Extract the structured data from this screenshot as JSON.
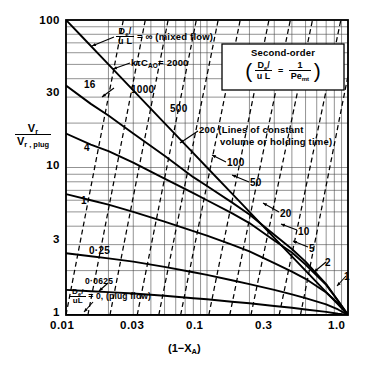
{
  "chart_data": {
    "type": "line",
    "title": "",
    "xlabel": "(1-X_A)",
    "ylabel": "V_r / V_r, plug",
    "xscale": "log",
    "yscale": "log",
    "xlim": [
      0.01,
      1.0
    ],
    "ylim": [
      1,
      100
    ],
    "grid": true,
    "legend_position": "upper-right",
    "xticks": [
      "0.01",
      "0.03",
      "0.1",
      "0.3",
      "1.0"
    ],
    "xtick_values": [
      0.01,
      0.03,
      0.1,
      0.3,
      1.0
    ],
    "yticks": [
      "1",
      "3",
      "10",
      "30",
      "100"
    ],
    "ytick_values": [
      1,
      3,
      10,
      30,
      100
    ],
    "series": [
      {
        "name": "De/uL = infinity (mixed flow)",
        "label": "",
        "style": "solid",
        "points": [
          [
            0.01,
            100
          ],
          [
            0.013,
            77
          ],
          [
            0.02,
            50
          ],
          [
            0.03,
            33.3
          ],
          [
            0.05,
            20
          ],
          [
            0.08,
            12.5
          ],
          [
            0.1,
            10
          ],
          [
            0.15,
            6.67
          ],
          [
            0.2,
            5
          ],
          [
            0.3,
            3.33
          ],
          [
            0.4,
            2.5
          ],
          [
            0.5,
            2
          ],
          [
            0.7,
            1.43
          ],
          [
            0.85,
            1.18
          ],
          [
            1.0,
            1
          ]
        ]
      },
      {
        "name": "De/uL = 16",
        "label": "16",
        "style": "solid",
        "points": [
          [
            0.01,
            36
          ],
          [
            0.015,
            27
          ],
          [
            0.02,
            22.5
          ],
          [
            0.03,
            17
          ],
          [
            0.05,
            12
          ],
          [
            0.08,
            8.6
          ],
          [
            0.1,
            7.5
          ],
          [
            0.15,
            5.8
          ],
          [
            0.2,
            4.8
          ],
          [
            0.3,
            3.5
          ],
          [
            0.4,
            2.8
          ],
          [
            0.5,
            2.3
          ],
          [
            0.7,
            1.62
          ],
          [
            0.85,
            1.25
          ],
          [
            1.0,
            1
          ]
        ]
      },
      {
        "name": "De/uL = 4",
        "label": "4",
        "style": "solid",
        "points": [
          [
            0.01,
            17
          ],
          [
            0.015,
            14.3
          ],
          [
            0.02,
            12.9
          ],
          [
            0.03,
            10.8
          ],
          [
            0.05,
            8.4
          ],
          [
            0.08,
            6.7
          ],
          [
            0.1,
            6.0
          ],
          [
            0.15,
            4.9
          ],
          [
            0.2,
            4.2
          ],
          [
            0.3,
            3.2
          ],
          [
            0.4,
            2.65
          ],
          [
            0.5,
            2.2
          ],
          [
            0.7,
            1.6
          ],
          [
            0.85,
            1.25
          ],
          [
            1.0,
            1
          ]
        ]
      },
      {
        "name": "De/uL = 1",
        "label": "1",
        "style": "solid",
        "points": [
          [
            0.01,
            6.6
          ],
          [
            0.015,
            6.0
          ],
          [
            0.02,
            5.6
          ],
          [
            0.03,
            5.0
          ],
          [
            0.05,
            4.3
          ],
          [
            0.08,
            3.7
          ],
          [
            0.1,
            3.45
          ],
          [
            0.15,
            3.0
          ],
          [
            0.2,
            2.7
          ],
          [
            0.3,
            2.25
          ],
          [
            0.4,
            1.97
          ],
          [
            0.5,
            1.76
          ],
          [
            0.7,
            1.42
          ],
          [
            0.85,
            1.2
          ],
          [
            1.0,
            1
          ]
        ]
      },
      {
        "name": "De/uL = 0.25",
        "label": "0·25",
        "style": "solid",
        "points": [
          [
            0.01,
            2.62
          ],
          [
            0.015,
            2.5
          ],
          [
            0.02,
            2.42
          ],
          [
            0.03,
            2.3
          ],
          [
            0.05,
            2.12
          ],
          [
            0.08,
            1.95
          ],
          [
            0.1,
            1.87
          ],
          [
            0.15,
            1.72
          ],
          [
            0.2,
            1.62
          ],
          [
            0.3,
            1.48
          ],
          [
            0.4,
            1.38
          ],
          [
            0.5,
            1.3
          ],
          [
            0.7,
            1.18
          ],
          [
            0.85,
            1.09
          ],
          [
            1.0,
            1
          ]
        ]
      },
      {
        "name": "De/uL = 0.0625",
        "label": "0·0625",
        "style": "solid",
        "points": [
          [
            0.01,
            1.48
          ],
          [
            0.015,
            1.45
          ],
          [
            0.02,
            1.43
          ],
          [
            0.03,
            1.4
          ],
          [
            0.05,
            1.35
          ],
          [
            0.08,
            1.3
          ],
          [
            0.1,
            1.28
          ],
          [
            0.15,
            1.23
          ],
          [
            0.2,
            1.2
          ],
          [
            0.3,
            1.15
          ],
          [
            0.4,
            1.12
          ],
          [
            0.5,
            1.09
          ],
          [
            0.7,
            1.05
          ],
          [
            0.85,
            1.02
          ],
          [
            1.0,
            1
          ]
        ]
      },
      {
        "name": "De/uL = 0 (plug flow)",
        "label": "",
        "style": "solid",
        "points": [
          [
            0.01,
            1
          ],
          [
            1.0,
            1
          ]
        ]
      }
    ],
    "constant_ktc_lines": [
      {
        "label": "2000",
        "style": "dashed",
        "ktCao": 2000
      },
      {
        "label": "1000",
        "style": "dashed",
        "ktCao": 1000
      },
      {
        "label": "500",
        "style": "dashed",
        "ktCao": 500
      },
      {
        "label": "200",
        "style": "dashed",
        "ktCao": 200
      },
      {
        "label": "100",
        "style": "dashed",
        "ktCao": 100
      },
      {
        "label": "50",
        "style": "dashed",
        "ktCao": 50
      },
      {
        "label": "20",
        "style": "dashed",
        "ktCao": 20
      },
      {
        "label": "10",
        "style": "dashed",
        "ktCao": 10
      },
      {
        "label": "5",
        "style": "dashed",
        "ktCao": 5
      },
      {
        "label": "2",
        "style": "dashed",
        "ktCao": 2
      },
      {
        "label": "1",
        "style": "dashed",
        "ktCao": 1
      }
    ],
    "annotations": {
      "mixed_flow": "= ∞ (mixed flow)",
      "mixed_flow_frac_num": "D",
      "mixed_flow_frac_den": "u L",
      "ktc_label": "= 2000",
      "ktc_symbol": "kτC",
      "ktc_sub": "AO",
      "constant_volume_1": "(Lines of constant",
      "constant_volume_2": "volume or holding time)",
      "constant_volume_lead": "200",
      "plug_flow": "= 0, (plug flow)",
      "legend_title": "Second-order",
      "legend_lhs_num": "D",
      "legend_lhs_den": "u L",
      "legend_eq": "=",
      "legend_rhs_num": "1",
      "legend_rhs_den": "Pe",
      "legend_rhs_sub": "mt"
    },
    "axis_text": {
      "x_label_main": "(1−X",
      "x_label_sub": "A",
      "x_label_close": ")",
      "y_label_num": "V",
      "y_label_num_sub": "r",
      "y_label_den": "V",
      "y_label_den_sub": "r , plug"
    },
    "colors": {
      "ink": "#000000",
      "grid": "#555555",
      "background": "#ffffff"
    }
  }
}
